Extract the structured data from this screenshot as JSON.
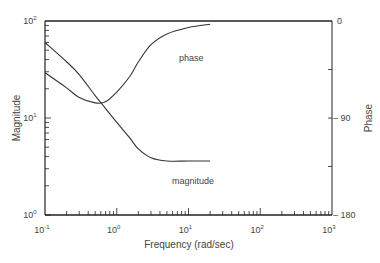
{
  "chart_data": {
    "type": "line",
    "title": "",
    "xlabel": "Frequency (rad/sec)",
    "ylabel_left": "Magnitude",
    "ylabel_right": "Phase",
    "xscale": "log",
    "yscale_left": "log",
    "xlim": [
      0.1,
      1000
    ],
    "ylim_left": [
      1,
      100
    ],
    "ylim_right": [
      -180,
      0
    ],
    "x_ticks": [
      "10^-1",
      "10^0",
      "10^1",
      "10^2",
      "10^3"
    ],
    "y_left_ticks": [
      "10^0",
      "10^1",
      "10^2"
    ],
    "y_right_ticks": [
      "0",
      "-90",
      "-180"
    ],
    "grid": false,
    "legend": "inline annotations",
    "annotations": [
      "phase",
      "magnitude"
    ],
    "series": [
      {
        "name": "magnitude",
        "axis": "left",
        "x": [
          0.1,
          0.2,
          0.3,
          0.5,
          0.7,
          1.0,
          1.5,
          2.0,
          3.0,
          5.0,
          10,
          20
        ],
        "values": [
          60,
          38,
          28,
          17,
          12.5,
          9.0,
          6.3,
          4.8,
          3.9,
          3.6,
          3.6,
          3.6
        ]
      },
      {
        "name": "phase",
        "axis": "right",
        "x": [
          0.1,
          0.2,
          0.3,
          0.5,
          0.7,
          1.0,
          1.5,
          2.0,
          3.0,
          5.0,
          10,
          20
        ],
        "values": [
          -48,
          -62,
          -71,
          -76,
          -75,
          -66,
          -52,
          -38,
          -22,
          -12,
          -6,
          -3
        ]
      }
    ]
  },
  "labels": {
    "xlabel": "Frequency (rad/sec)",
    "ylabel_left": "Magnitude",
    "ylabel_right": "Phase",
    "phase_annotation": "phase",
    "magnitude_annotation": "magnitude",
    "x_ticks": [
      {
        "base": "10",
        "exp": "-1"
      },
      {
        "base": "10",
        "exp": "0"
      },
      {
        "base": "10",
        "exp": "1"
      },
      {
        "base": "10",
        "exp": "2"
      },
      {
        "base": "10",
        "exp": "3"
      }
    ],
    "y_left_ticks": [
      {
        "base": "10",
        "exp": "2"
      },
      {
        "base": "10",
        "exp": "1"
      },
      {
        "base": "10",
        "exp": "0"
      }
    ],
    "y_right_ticks": [
      "0",
      "– 90",
      "– 180"
    ]
  },
  "colors": {
    "axis": "#222222",
    "curve": "#333333",
    "text": "#444444"
  }
}
